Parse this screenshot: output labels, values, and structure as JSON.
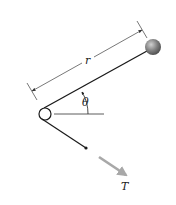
{
  "figure": {
    "type": "physics-diagram",
    "labels": {
      "radius": "r",
      "angle": "θ",
      "force": "T"
    },
    "colors": {
      "background": "#ffffff",
      "line": "#1a1a1a",
      "dimension_line": "#555555",
      "ball_fill": "#8a8a8a",
      "ball_highlight": "#c8c8c8",
      "force_arrow": "#a8a8a8"
    },
    "geometry": {
      "pulley_center": [
        45,
        114
      ],
      "pulley_radius": 6,
      "ball_center": [
        153,
        47
      ],
      "ball_radius": 8,
      "rod_start": [
        44,
        108
      ],
      "rod_end": [
        147,
        51
      ],
      "string_end": [
        86,
        148
      ],
      "force_arrow_start": [
        99,
        157
      ],
      "force_arrow_end": [
        129,
        177
      ]
    }
  }
}
